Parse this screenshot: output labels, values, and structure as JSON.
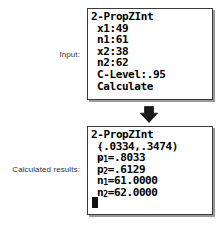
{
  "page": {
    "background_color": "#ffffff",
    "text_color": "#333333",
    "screen_border_color": "#3a3a3a",
    "screen_fill_color": "#ffffff",
    "screen_text_color": "#000000"
  },
  "captions": {
    "input_label": "Input:",
    "results_label": "Calculated results:"
  },
  "arrow": {
    "icon": "down-arrow-icon",
    "direction": "down",
    "color": "#1a1a1a"
  },
  "input_screen": {
    "name": "2-PropZInt input screen",
    "title": "2-PropZInt",
    "fields": [
      {
        "label": "x1",
        "separator": ":",
        "value": "49",
        "line": "x1:49"
      },
      {
        "label": "n1",
        "separator": ":",
        "value": "61",
        "line": "n1:61"
      },
      {
        "label": "x2",
        "separator": ":",
        "value": "38",
        "line": "x2:38"
      },
      {
        "label": "n2",
        "separator": ":",
        "value": "62",
        "line": "n2:62"
      },
      {
        "label": "C-Level",
        "separator": ":",
        "value": ".95",
        "line": "C-Level:.95"
      }
    ],
    "action": "Calculate"
  },
  "results_screen": {
    "name": "2-PropZInt results screen",
    "title": "2-PropZInt",
    "interval": "(.0334,.3474)",
    "interval_lower": ".0334",
    "interval_upper": ".3474",
    "rows": [
      {
        "symbol": "p-hat",
        "subscript": "1",
        "operator": "=",
        "value": ".8033",
        "line": "p̂1=.8033"
      },
      {
        "symbol": "p-hat",
        "subscript": "2",
        "operator": "=",
        "value": ".6129",
        "line": "p̂2=.6129"
      },
      {
        "symbol": "n",
        "subscript": "1",
        "operator": "=",
        "value": "61.0000",
        "line": "n1=61.0000"
      },
      {
        "symbol": "n",
        "subscript": "2",
        "operator": "=",
        "value": "62.0000",
        "line": "n2=62.0000"
      }
    ],
    "phat_letter": "p",
    "phat_hat": "ˆ",
    "n_letter": "n",
    "equals": "=",
    "cursor": "█"
  }
}
